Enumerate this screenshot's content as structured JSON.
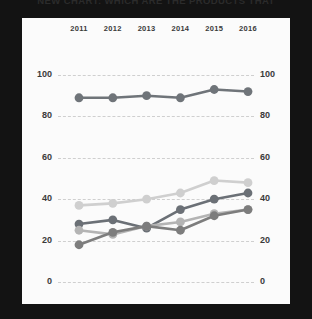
{
  "title": "NEW CHART: WHICH ARE THE PRODUCTS THAT",
  "axis": {
    "yticks": [
      "100",
      "80",
      "60",
      "40",
      "20",
      "0"
    ],
    "ytick_values": [
      100,
      80,
      60,
      40,
      20,
      0
    ]
  },
  "chart_data": {
    "type": "line",
    "title": "NEW CHART: WHICH ARE THE PRODUCTS THAT",
    "xlabel": "",
    "ylabel": "",
    "categories": [
      "2011",
      "2012",
      "2013",
      "2014",
      "2015",
      "2016"
    ],
    "x": [
      2011,
      2012,
      2013,
      2014,
      2015,
      2016
    ],
    "ylim": [
      0,
      100
    ],
    "yticks": [
      0,
      20,
      40,
      60,
      80,
      100
    ],
    "grid": "horizontal-dashed",
    "legend": "none",
    "dual_axis": true,
    "markers": "circle",
    "series": [
      {
        "name": "series-1",
        "color": "#6f7479",
        "values": [
          89,
          89,
          90,
          89,
          93,
          92
        ]
      },
      {
        "name": "series-2",
        "color": "#cfcfcf",
        "values": [
          37,
          38,
          40,
          43,
          49,
          48
        ]
      },
      {
        "name": "series-3",
        "color": "#6b7076",
        "values": [
          28,
          30,
          26,
          35,
          40,
          43
        ]
      },
      {
        "name": "series-4",
        "color": "#b4b4b4",
        "values": [
          25,
          23,
          27,
          29,
          33,
          35
        ]
      },
      {
        "name": "series-5",
        "color": "#7d7d7d",
        "values": [
          18,
          24,
          27,
          25,
          32,
          35
        ]
      }
    ]
  }
}
